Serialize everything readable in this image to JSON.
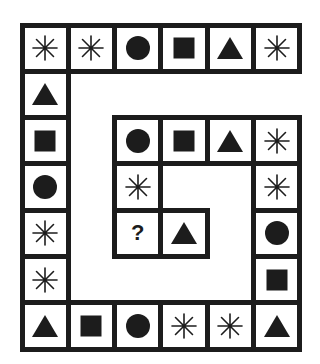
{
  "puzzle": {
    "grid": {
      "origin_x": 22,
      "origin_y": 25,
      "cell_size": 46.3,
      "cols": 6,
      "rows": 7
    },
    "colors": {
      "ink": "#1c1c1c",
      "background": "#ffffff"
    },
    "cells": [
      {
        "row": 0,
        "col": 0,
        "symbol": "asterisk"
      },
      {
        "row": 0,
        "col": 1,
        "symbol": "asterisk"
      },
      {
        "row": 0,
        "col": 2,
        "symbol": "circle"
      },
      {
        "row": 0,
        "col": 3,
        "symbol": "square"
      },
      {
        "row": 0,
        "col": 4,
        "symbol": "triangle"
      },
      {
        "row": 0,
        "col": 5,
        "symbol": "asterisk"
      },
      {
        "row": 1,
        "col": 0,
        "symbol": "triangle"
      },
      {
        "row": 2,
        "col": 0,
        "symbol": "square"
      },
      {
        "row": 3,
        "col": 0,
        "symbol": "circle"
      },
      {
        "row": 4,
        "col": 0,
        "symbol": "asterisk"
      },
      {
        "row": 5,
        "col": 0,
        "symbol": "asterisk"
      },
      {
        "row": 6,
        "col": 0,
        "symbol": "triangle"
      },
      {
        "row": 6,
        "col": 1,
        "symbol": "square"
      },
      {
        "row": 6,
        "col": 2,
        "symbol": "circle"
      },
      {
        "row": 6,
        "col": 3,
        "symbol": "asterisk"
      },
      {
        "row": 6,
        "col": 4,
        "symbol": "asterisk"
      },
      {
        "row": 6,
        "col": 5,
        "symbol": "triangle"
      },
      {
        "row": 5,
        "col": 5,
        "symbol": "square"
      },
      {
        "row": 4,
        "col": 5,
        "symbol": "circle"
      },
      {
        "row": 3,
        "col": 5,
        "symbol": "asterisk"
      },
      {
        "row": 2,
        "col": 5,
        "symbol": "asterisk"
      },
      {
        "row": 2,
        "col": 4,
        "symbol": "triangle"
      },
      {
        "row": 2,
        "col": 3,
        "symbol": "square"
      },
      {
        "row": 2,
        "col": 2,
        "symbol": "circle"
      },
      {
        "row": 3,
        "col": 2,
        "symbol": "asterisk"
      },
      {
        "row": 4,
        "col": 2,
        "symbol": "question",
        "label": "?"
      },
      {
        "row": 4,
        "col": 3,
        "symbol": "triangle"
      }
    ]
  }
}
